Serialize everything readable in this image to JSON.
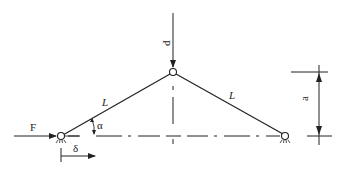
{
  "diagram": {
    "type": "two-bar truss (von Mises truss) with central load",
    "labels": {
      "load_P": "P",
      "force_F": "F",
      "bar_left_length": "L",
      "bar_right_length": "L",
      "angle": "α",
      "displacement": "δ",
      "height": "a"
    },
    "colors": {
      "line": "#222222",
      "background": "#ffffff"
    }
  }
}
